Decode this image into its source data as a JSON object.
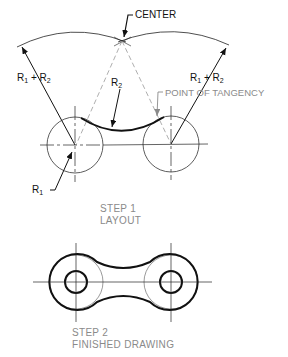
{
  "labels": {
    "center": "CENTER",
    "r1_plus_r2_left": {
      "a": "R",
      "a_sub": "1",
      "plus": " + ",
      "b": "R",
      "b_sub": "2"
    },
    "r1_plus_r2_right": {
      "a": "R",
      "a_sub": "1",
      "plus": " + ",
      "b": "R",
      "b_sub": "2"
    },
    "r2": {
      "a": "R",
      "a_sub": "2"
    },
    "r1": {
      "a": "R",
      "a_sub": "1"
    },
    "point_of_tangency": "POINT OF TANGENCY"
  },
  "captions": {
    "step1_line1": "STEP 1",
    "step1_line2": "LAYOUT",
    "step2_line1": "STEP 2",
    "step2_line2": "FINISHED DRAWING"
  },
  "colors": {
    "ink": "#111111",
    "construction": "#8a8a8a"
  }
}
